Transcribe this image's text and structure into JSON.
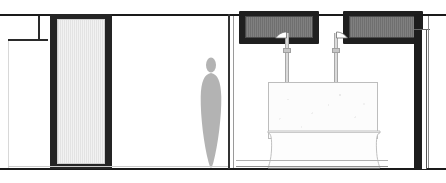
{
  "drawing": {
    "title": "Bathroom Elevation",
    "type": "architectural-elevation",
    "width_px": 446,
    "height_px": 183,
    "background_color": "#ffffff",
    "line_color": "#1a1a1a",
    "accent_dark": "#1f1f1f",
    "glass_fill": "#e8e8e8",
    "figure_color": "#b3b3b3"
  },
  "structure": {
    "ceiling_label": "ceiling-datum-line",
    "floor_label": "floor-datum-line",
    "partition_label": "room-partition-wall",
    "left_wall_label": "left-exterior-wall",
    "right_wall_label": "right-end-wall"
  },
  "elements": {
    "door": {
      "name": "glazed-door-panel",
      "frame_color": "#242424",
      "glass_pattern": "vertical-hatch"
    },
    "person": {
      "name": "human-scale-figure",
      "fill": "#b3b3b3"
    },
    "panels": [
      {
        "name": "wall-niche-left",
        "frame_color": "#1f1f1f",
        "fill_pattern": "vertical-hatch"
      },
      {
        "name": "wall-niche-right",
        "frame_color": "#1f1f1f",
        "fill_pattern": "vertical-hatch"
      }
    ],
    "showers": [
      {
        "name": "shower-riser-left",
        "head": "angled-shower-head"
      },
      {
        "name": "shower-riser-right",
        "head": "angled-shower-head"
      }
    ],
    "tub": {
      "name": "bathtub",
      "body_fill": "#fcfcfc",
      "outline": "#bdbdbd"
    }
  }
}
